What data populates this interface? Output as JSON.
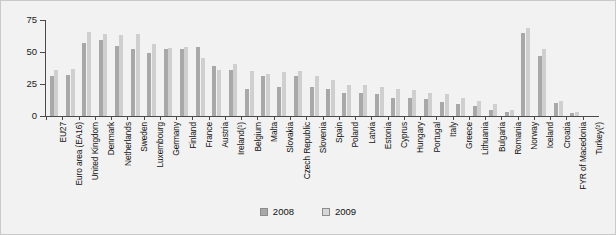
{
  "chart_data": {
    "type": "bar",
    "title": "",
    "subtitle": "",
    "xlabel": "",
    "ylabel": "",
    "ylim": [
      0,
      75
    ],
    "yticks": [
      0,
      25,
      50,
      75
    ],
    "ytick_labels": [
      "0",
      "25",
      "50",
      "75"
    ],
    "grid": false,
    "legend_position": "bottom-center",
    "categories": [
      "EU27",
      "Euro area (EA16)",
      "United Kingdom",
      "Denmark",
      "Netherlands",
      "Sweden",
      "Luxembourg",
      "Germany",
      "Finland",
      "France",
      "Austria",
      "Ireland(¹)",
      "Belgium",
      "Malta",
      "Slovakia",
      "Czech Republic",
      "Slovenia",
      "Spain",
      "Poland",
      "Latvia",
      "Estonia",
      "Cyprus",
      "Hungary",
      "Portugal",
      "Italy",
      "Greece",
      "Lithuania",
      "Bulgaria",
      "Romania",
      "Norway",
      "Iceland",
      "Croatia",
      "FYR of Macedonia",
      "Turkey(²)"
    ],
    "series": [
      {
        "name": "2008",
        "color": "#a8a8a8",
        "values": [
          31,
          32,
          57,
          59,
          55,
          52,
          49,
          52,
          52,
          54,
          39,
          36,
          21,
          31,
          23,
          31,
          23,
          21,
          18,
          18,
          17,
          14,
          14,
          13,
          11,
          9,
          8,
          5,
          3,
          65,
          47,
          10,
          2,
          null
        ]
      },
      {
        "name": "2009",
        "color": "#cfcfcf",
        "values": [
          36,
          37,
          66,
          64,
          63,
          64,
          56,
          53,
          54,
          45,
          36,
          41,
          35,
          33,
          34,
          35,
          31,
          28,
          24,
          24,
          23,
          21,
          20,
          18,
          17,
          14,
          12,
          9,
          5,
          69,
          52,
          12,
          3,
          null
        ]
      }
    ],
    "legend": [
      "2008",
      "2009"
    ],
    "footnotes": [
      "(¹) Ireland",
      "(²) Turkey"
    ]
  },
  "legend": {
    "items": [
      {
        "label": "2008",
        "swatch_class": "s2008"
      },
      {
        "label": "2009",
        "swatch_class": "s2009"
      }
    ]
  }
}
